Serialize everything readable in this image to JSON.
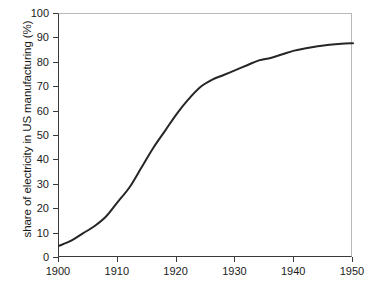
{
  "chart_data": {
    "type": "line",
    "title": "",
    "subtitle": "",
    "xlabel": "",
    "ylabel": "share of electricity in US manufacturing (%)",
    "xlim": [
      1900,
      1950
    ],
    "ylim": [
      0,
      100
    ],
    "grid": false,
    "legend": "none",
    "xticks": [
      "1900",
      "1910",
      "1920",
      "1930",
      "1940",
      "1950"
    ],
    "xtick_values": [
      1900,
      1910,
      1920,
      1930,
      1940,
      1950
    ],
    "yticks": [
      "0",
      "10",
      "20",
      "30",
      "40",
      "50",
      "60",
      "70",
      "80",
      "90",
      "100"
    ],
    "ytick_values": [
      0,
      10,
      20,
      30,
      40,
      50,
      60,
      70,
      80,
      90,
      100
    ],
    "line_color": "#262626",
    "line_width": 2,
    "series": [
      {
        "name": "share of electricity in US manufacturing",
        "x": [
          1900,
          1902,
          1904,
          1906,
          1908,
          1910,
          1912,
          1914,
          1916,
          1918,
          1920,
          1922,
          1924,
          1926,
          1928,
          1930,
          1932,
          1934,
          1936,
          1938,
          1940,
          1942,
          1944,
          1946,
          1948,
          1950
        ],
        "values": [
          5,
          7,
          10,
          13,
          17,
          23,
          29,
          37,
          45,
          52,
          59,
          65,
          70,
          73,
          75,
          77,
          79,
          81,
          82,
          83.5,
          85,
          86,
          86.8,
          87.4,
          87.8,
          88
        ]
      }
    ],
    "annotations": []
  },
  "axes": {
    "y_title": "share of electricity in US manufacturing (%)",
    "y_tick_labels": [
      "100",
      "90",
      "80",
      "70",
      "60",
      "50",
      "40",
      "30",
      "20",
      "10",
      "0"
    ],
    "x_tick_labels": [
      "1900",
      "1910",
      "1920",
      "1930",
      "1940",
      "1950"
    ]
  }
}
